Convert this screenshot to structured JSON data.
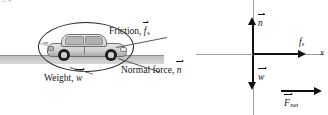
{
  "figure": {
    "top_fragment": "2.4",
    "pictorial": {
      "callouts": [
        {
          "id": "friction",
          "text": "Friction, ",
          "symbol": "f",
          "subscript": "s",
          "vector": true
        },
        {
          "id": "normal-force",
          "text": "Normal force, ",
          "symbol": "n",
          "subscript": "",
          "vector": true
        },
        {
          "id": "weight",
          "text": "Weight, ",
          "symbol": "w",
          "subscript": "",
          "vector": true
        }
      ],
      "object": "car",
      "ground_label": "ground-surface",
      "system_boundary": "ellipse"
    },
    "vector_diagram": {
      "axis_x_label": "x",
      "vectors": [
        {
          "id": "normal",
          "symbol": "n",
          "subscript": "",
          "direction": "up"
        },
        {
          "id": "weight",
          "symbol": "w",
          "subscript": "",
          "direction": "down"
        },
        {
          "id": "friction",
          "symbol": "f",
          "subscript": "s",
          "direction": "right"
        },
        {
          "id": "net",
          "symbol": "F",
          "subscript": "net",
          "direction": "right"
        }
      ]
    }
  },
  "colors": {
    "ink": "#111111",
    "axis": "#a0a0a0",
    "ground": "#c9c9c9",
    "leader": "#5d5d5d"
  }
}
